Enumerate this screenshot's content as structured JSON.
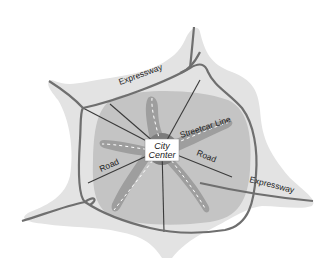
{
  "diagram": {
    "title": "",
    "labels": {
      "expressway_top": "Expressway",
      "expressway_right": "Expressway",
      "streetcar_line": "Streetcar Line",
      "road_left": "Road",
      "road_right": "Road",
      "city_center_line1": "City",
      "city_center_line2": "Center"
    },
    "colors": {
      "background": "#ffffff",
      "outer_urban_area": "#e3e3e3",
      "inner_urban_area": "#c4c4c4",
      "streetcar_corridor": "#9e9e9e",
      "core": "#7c7c7c",
      "expressway": "#6f6f6f",
      "road": "#3a3a3a",
      "streetcar_dash": "#ffffff",
      "center_box": "#ffffff"
    },
    "elements": [
      "outer-urban-area",
      "inner-urban-area",
      "streetcar-corridors",
      "streetcar-lines",
      "radial-roads",
      "expressway-ring",
      "expressway-spurs",
      "city-center-box"
    ]
  }
}
